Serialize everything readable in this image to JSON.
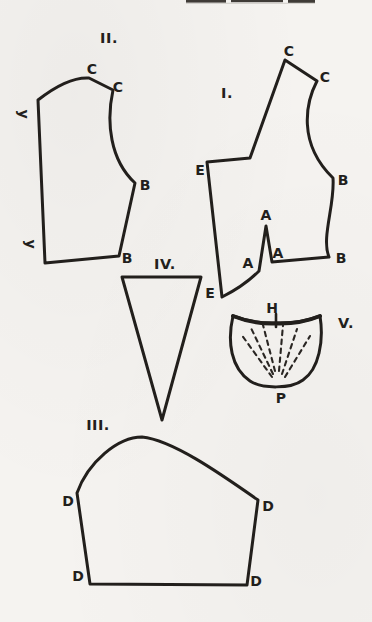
{
  "colors": {
    "ink": "#221f1c",
    "paper": "#f5f3f0"
  },
  "pieces": {
    "i": {
      "numeral": "I.",
      "points": {
        "c1": "C",
        "c2": "C",
        "e1": "E",
        "e2": "E",
        "b1": "B",
        "b2": "B",
        "a_apex": "A",
        "a_left": "A",
        "a_right": "A"
      }
    },
    "ii": {
      "numeral": "II.",
      "points": {
        "c1": "C",
        "c2": "C",
        "b1": "B",
        "b2": "B",
        "y1": "y",
        "y2": "y"
      }
    },
    "iii": {
      "numeral": "III.",
      "points": {
        "d_upper_left": "D",
        "d_upper_right": "D",
        "d_lower_left": "D",
        "d_lower_right": "D"
      }
    },
    "iv": {
      "numeral": "IV."
    },
    "v": {
      "numeral": "V.",
      "points": {
        "h": "H",
        "p": "P"
      }
    }
  }
}
